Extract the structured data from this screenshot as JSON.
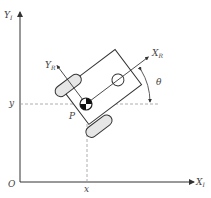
{
  "diagram": {
    "labels": {
      "y_inertial": "Y",
      "y_inertial_sub": "I",
      "x_inertial": "X",
      "x_inertial_sub": "I",
      "origin": "O",
      "x_coord": "x",
      "y_coord": "y",
      "y_robot": "Y",
      "y_robot_sub": "R",
      "x_robot": "X",
      "x_robot_sub": "R",
      "point": "P",
      "angle": "θ"
    },
    "colors": {
      "line": "#333333",
      "dashed": "#9a9a9a",
      "wheel_fill": "#e6e6e6",
      "text": "#444444"
    }
  }
}
